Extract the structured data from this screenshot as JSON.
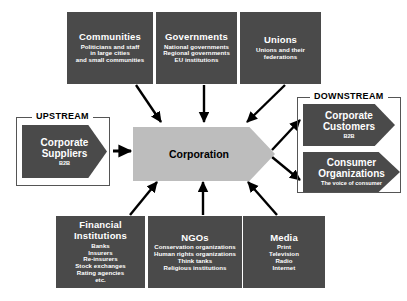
{
  "diagram": {
    "colors": {
      "node_fill": "#4a4a4a",
      "node_text": "#ffffff",
      "center_fill": "#bdbdbd",
      "center_text": "#000000",
      "arrow": "#000000",
      "frame": "#555555",
      "background": "#ffffff"
    }
  },
  "center": {
    "label": "Corporation"
  },
  "groups": {
    "upstream": {
      "label": "UPSTREAM"
    },
    "downstream": {
      "label": "DOWNSTREAM"
    }
  },
  "top_nodes": [
    {
      "title": "Communities",
      "lines": [
        "Politicians and staff",
        "in large cities",
        "and small communities"
      ]
    },
    {
      "title": "Governments",
      "lines": [
        "National governments",
        "Regional governments",
        "EU institutions"
      ]
    },
    {
      "title": "Unions",
      "lines": [
        "Unions and their",
        "federations"
      ]
    }
  ],
  "bottom_nodes": [
    {
      "title": "Financial Institutions",
      "lines": [
        "Banks",
        "Insurers",
        "Re-insurers",
        "Stock exchanges",
        "Rating agencies",
        "etc."
      ]
    },
    {
      "title": "NGOs",
      "lines": [
        "Conservation organizations",
        "Human rights organizations",
        "Think tanks",
        "Religious institutions"
      ]
    },
    {
      "title": "Media",
      "lines": [
        "Print",
        "Television",
        "Radio",
        "Internet"
      ]
    }
  ],
  "upstream_nodes": [
    {
      "title_lines": [
        "Corporate",
        "Suppliers"
      ],
      "sub": "B2B"
    }
  ],
  "downstream_nodes": [
    {
      "title_lines": [
        "Corporate",
        "Customers"
      ],
      "sub": "B2B"
    },
    {
      "title_lines": [
        "Consumer",
        "Organizations"
      ],
      "sub": "The voice of consumer"
    }
  ]
}
